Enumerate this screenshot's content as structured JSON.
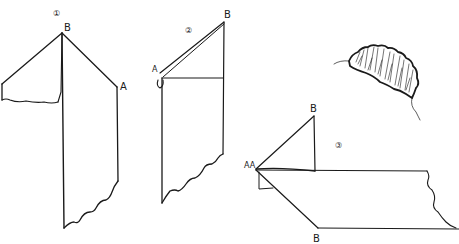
{
  "figure": {
    "type": "folding instructions diagram",
    "steps": [
      {
        "number": "1",
        "step_label": "①",
        "point_labels": [
          "B",
          "A"
        ]
      },
      {
        "number": "2",
        "step_label": "②",
        "point_labels": [
          "B",
          "A"
        ]
      },
      {
        "number": "3",
        "step_label": "③",
        "point_labels": [
          "B",
          "AA",
          "B"
        ]
      }
    ],
    "illustration": {
      "subject": "caterpillar-like folded result (sketch)"
    }
  }
}
